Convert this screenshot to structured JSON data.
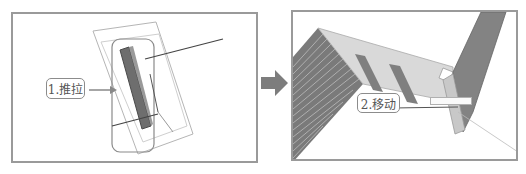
{
  "figure": {
    "left_panel": {
      "step_label": "1.推拉",
      "scene": "push-pull of a vertical beam inside a bounding box"
    },
    "right_panel": {
      "step_label": "2.移动",
      "tooltip_text": "",
      "scene": "moving a wall panel with window openings"
    },
    "arrow_icon": "right-arrow",
    "caption": ""
  },
  "colors": {
    "frame_border": "#9a9a9a",
    "arrow_fill": "#7d7d7d",
    "beam_fill": "#6e6e6e",
    "wall_fill": "#d9d9d9",
    "panel_dark": "#808080"
  }
}
